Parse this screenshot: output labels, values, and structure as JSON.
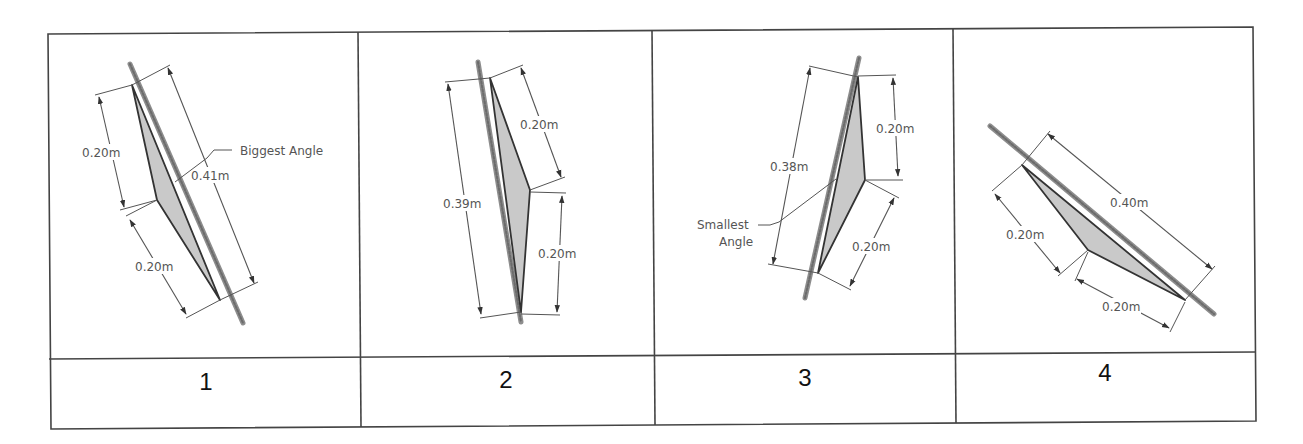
{
  "table": {
    "columns": [
      {
        "label": "1",
        "annotation": "Biggest Angle",
        "dimensions": {
          "side_a": "0.20m",
          "side_b": "0.20m",
          "base": "0.41m"
        }
      },
      {
        "label": "2",
        "annotation": "",
        "dimensions": {
          "side_a": "0.20m",
          "side_b": "0.20m",
          "base": "0.39m"
        }
      },
      {
        "label": "3",
        "annotation_line1": "Smallest",
        "annotation_line2": "Angle",
        "dimensions": {
          "side_a": "0.20m",
          "side_b": "0.20m",
          "base": "0.38m"
        }
      },
      {
        "label": "4",
        "annotation": "",
        "dimensions": {
          "side_a": "0.20m",
          "side_b": "0.20m",
          "base": "0.40m"
        }
      }
    ]
  },
  "colors": {
    "triangle_fill": "#c9c9c9",
    "triangle_edge": "#333333",
    "dimension_line": "#555555",
    "grid_line": "#444444"
  }
}
